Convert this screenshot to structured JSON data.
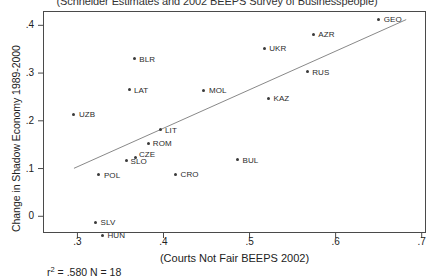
{
  "chart_data": {
    "type": "scatter",
    "title": "(Schneider Estimates and 2002 BEEPS Survey of Businesspeople)",
    "xlabel": "(Courts Not Fair BEEPS 2002)",
    "ylabel": "Change in Shadow Economy 1989-2000",
    "xlim": [
      0.26,
      0.705
    ],
    "ylim": [
      -0.035,
      0.43
    ],
    "xticks": [
      ".3",
      ".4",
      ".5",
      ".6",
      ".7"
    ],
    "xtick_values": [
      0.3,
      0.4,
      0.5,
      0.6,
      0.7
    ],
    "yticks": [
      "0",
      ".1",
      ".2",
      ".3",
      ".4"
    ],
    "ytick_values": [
      0.0,
      0.1,
      0.2,
      0.3,
      0.4
    ],
    "grid": false,
    "legend": "none",
    "marker": "small-filled-circle",
    "annotation": "r² = .580 N = 18",
    "r_squared": 0.58,
    "n": 18,
    "fit_line": {
      "type": "linear-regression",
      "x_start": 0.296,
      "y_start": 0.1005,
      "x_end": 0.682,
      "y_end": 0.412
    },
    "points": [
      {
        "label": "UZB",
        "x": 0.296,
        "y": 0.2135
      },
      {
        "label": "BLR",
        "x": 0.366,
        "y": 0.3295
      },
      {
        "label": "LAT",
        "x": 0.361,
        "y": 0.2655
      },
      {
        "label": "MOL",
        "x": 0.447,
        "y": 0.2635
      },
      {
        "label": "UKR",
        "x": 0.517,
        "y": 0.3525
      },
      {
        "label": "AZR",
        "x": 0.574,
        "y": 0.3815
      },
      {
        "label": "GEO",
        "x": 0.65,
        "y": 0.4125
      },
      {
        "label": "RUS",
        "x": 0.567,
        "y": 0.3025
      },
      {
        "label": "KAZ",
        "x": 0.522,
        "y": 0.2475
      },
      {
        "label": "LIT",
        "x": 0.396,
        "y": 0.1815
      },
      {
        "label": "ROM",
        "x": 0.383,
        "y": 0.1525
      },
      {
        "label": "SLO",
        "x": 0.357,
        "y": 0.1165
      },
      {
        "label": "CZE",
        "x": 0.368,
        "y": 0.1235
      },
      {
        "label": "CRO",
        "x": 0.414,
        "y": 0.0885
      },
      {
        "label": "BUL",
        "x": 0.486,
        "y": 0.1185
      },
      {
        "label": "POL",
        "x": 0.325,
        "y": 0.0865
      },
      {
        "label": "SLV",
        "x": 0.321,
        "y": -0.0125
      },
      {
        "label": "HUN",
        "x": 0.329,
        "y": -0.0395
      }
    ],
    "point_label_offsets": {
      "UZB": {
        "dx": 5,
        "dy": -4
      },
      "BLR": {
        "dx": 5,
        "dy": -4
      },
      "LAT": {
        "dx": 4,
        "dy": -4
      },
      "MOL": {
        "dx": 5,
        "dy": -4
      },
      "UKR": {
        "dx": 5,
        "dy": -4
      },
      "AZR": {
        "dx": 5,
        "dy": -4
      },
      "GEO": {
        "dx": 5,
        "dy": -4
      },
      "RUS": {
        "dx": 5,
        "dy": -4
      },
      "KAZ": {
        "dx": 5,
        "dy": -4
      },
      "LIT": {
        "dx": 5,
        "dy": -4
      },
      "ROM": {
        "dx": 4,
        "dy": -4
      },
      "SLO": {
        "dx": 4,
        "dy": -4
      },
      "CZE": {
        "dx": 3,
        "dy": -7
      },
      "CRO": {
        "dx": 5,
        "dy": -4
      },
      "BUL": {
        "dx": 5,
        "dy": -4
      },
      "POL": {
        "dx": 5,
        "dy": -4
      },
      "SLV": {
        "dx": 5,
        "dy": -4
      },
      "HUN": {
        "dx": 5,
        "dy": -4
      }
    },
    "colors": {
      "marker": "#3a3a3a",
      "line": "#7a7a7a",
      "axis": "#4a4a4a",
      "text": "#222222",
      "background": "#ffffff"
    }
  }
}
